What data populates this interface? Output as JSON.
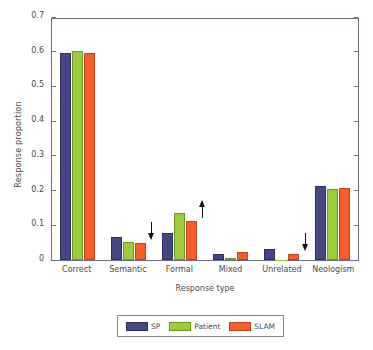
{
  "chart_data": {
    "type": "bar",
    "title": "",
    "xlabel": "Response type",
    "ylabel": "Response proportion",
    "categories": [
      "Correct",
      "Semantic",
      "Formal",
      "Mixed",
      "Unrelated",
      "Neologism"
    ],
    "series": [
      {
        "name": "SP",
        "color": "#464682",
        "values": [
          0.595,
          0.067,
          0.077,
          0.018,
          0.031,
          0.212
        ]
      },
      {
        "name": "Patient",
        "color": "#9ccb3b",
        "values": [
          0.601,
          0.053,
          0.136,
          0.006,
          0.001,
          0.204
        ]
      },
      {
        "name": "SLAM",
        "color": "#f3602d",
        "values": [
          0.595,
          0.048,
          0.111,
          0.023,
          0.017,
          0.208
        ]
      }
    ],
    "ylim": [
      0,
      0.7
    ],
    "yticks": [
      0,
      0.1,
      0.2,
      0.3,
      0.4,
      0.5,
      0.6,
      0.7
    ],
    "ytick_labels": [
      "0",
      "0.1",
      "0.2",
      "0.3",
      "0.4",
      "0.5",
      "0.6",
      "0.7"
    ],
    "grid": false,
    "legend_position": "bottom-center",
    "annotations": [
      {
        "category": "Semantic",
        "series": "SLAM",
        "direction": "down",
        "value": 0.048
      },
      {
        "category": "Formal",
        "series": "SLAM",
        "direction": "up",
        "value": 0.111
      },
      {
        "category": "Unrelated",
        "series": "SLAM",
        "direction": "down",
        "value": 0.017
      }
    ]
  },
  "legend": {
    "items": [
      {
        "label": "SP"
      },
      {
        "label": "Patient"
      },
      {
        "label": "SLAM"
      }
    ]
  }
}
